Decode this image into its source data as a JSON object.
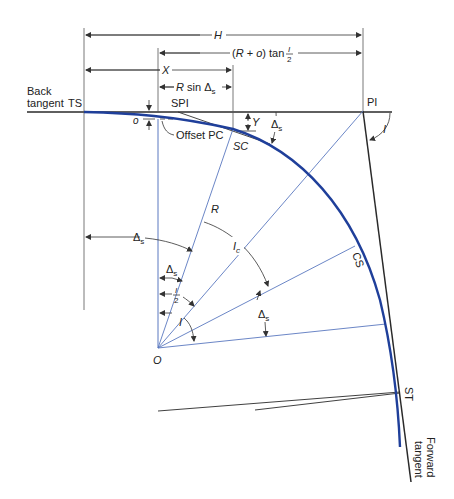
{
  "figure": {
    "colors": {
      "curve": "#1f3f9a",
      "radial_lines": "#5a78c0",
      "tangent_lines": "#2a2a2a",
      "dimension_lines": "#333333"
    }
  },
  "points": {
    "ts": "TS",
    "spi": "SPI",
    "sc": "SC",
    "pi": "PI",
    "cs": "CS",
    "st": "ST",
    "o": "O"
  },
  "labels": {
    "back_tangent_1": "Back",
    "back_tangent_2": "tangent",
    "forward_tangent_1": "Forward",
    "forward_tangent_2": "tangent",
    "offset_pc": "Offset PC",
    "o_small": "o",
    "y": "Y",
    "r": "R",
    "i": "I",
    "i_pi": "I",
    "ic_main": "I",
    "ic_sub": "c",
    "delta": "Δ",
    "delta_sub": "s",
    "half_num": "I",
    "half_den": "2"
  },
  "dimensions": {
    "h": "H",
    "x": "X",
    "rsin_r": "R",
    "rsin_mid": " sin ",
    "rsin_delta": "Δ",
    "rsin_sub": "s",
    "tan_left": "(",
    "tan_r": "R",
    "tan_plus": " + ",
    "tan_o": "o",
    "tan_right": ") tan ",
    "tan_num": "I",
    "tan_den": "2"
  }
}
